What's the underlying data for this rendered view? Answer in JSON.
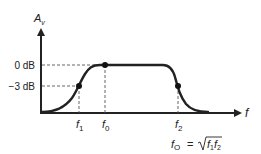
{
  "diagram": {
    "y_axis": {
      "label_main": "A",
      "label_sub": "v"
    },
    "x_axis": {
      "label": "f"
    },
    "levels": [
      {
        "name": "zero_db",
        "label": "0 dB",
        "y": 65
      },
      {
        "name": "minus3_db",
        "label": "−3 dB",
        "y": 86
      }
    ],
    "frequencies": [
      {
        "name": "f1",
        "main": "f",
        "sub": "1",
        "x": 79
      },
      {
        "name": "f0",
        "main": "f",
        "sub": "0",
        "x": 105
      },
      {
        "name": "f2",
        "main": "f",
        "sub": "2",
        "x": 178
      }
    ],
    "formula": {
      "lhs_main": "f",
      "lhs_sub": "O",
      "equals": "=",
      "radicand_1_main": "f",
      "radicand_1_sub": "1",
      "radicand_2_main": "f",
      "radicand_2_sub": "2"
    },
    "colors": {
      "curve": "#222222",
      "axis": "#222222",
      "dashed": "#555555"
    }
  }
}
